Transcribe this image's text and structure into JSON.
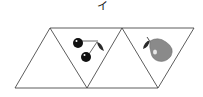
{
  "figure": {
    "label": "イ",
    "triangles": [
      {
        "position": "left",
        "orientation": "up",
        "content": ""
      },
      {
        "position": "middle",
        "orientation": "down",
        "content": "cherries"
      },
      {
        "position": "middle-right",
        "orientation": "up",
        "content": ""
      },
      {
        "position": "right",
        "orientation": "down",
        "content": "pear"
      }
    ]
  },
  "colors": {
    "line": "#333333",
    "cherry": "#111111",
    "pear": "#8a8a8a",
    "leaf": "#2a2a2a"
  }
}
